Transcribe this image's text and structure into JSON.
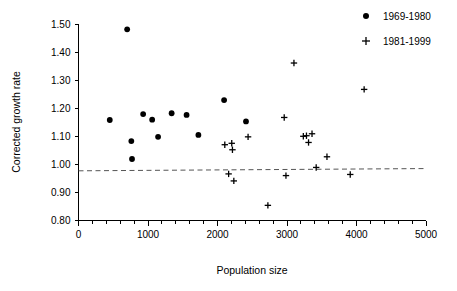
{
  "chart_data": {
    "type": "scatter",
    "title": "",
    "xlabel": "Population size",
    "ylabel": "Corrected growth rate",
    "xlim": [
      0,
      5000
    ],
    "ylim": [
      0.8,
      1.5
    ],
    "xticks": [
      0,
      1000,
      2000,
      3000,
      4000,
      5000
    ],
    "xtick_labels": [
      "0",
      "1000",
      "2000",
      "3000",
      "4000",
      "5000"
    ],
    "xminor_interval": 200,
    "yticks": [
      0.8,
      0.9,
      1.0,
      1.1,
      1.2,
      1.3,
      1.4,
      1.5
    ],
    "ytick_labels": [
      "0.80",
      "0.90",
      "1.00",
      "1.10",
      "1.20",
      "1.30",
      "1.40",
      "1.50"
    ],
    "grid": false,
    "legend_position": "top-right",
    "reference_line": {
      "style": "dashed",
      "label": "",
      "x_start": 0,
      "y_start": 0.977,
      "x_end": 5000,
      "y_end": 0.985,
      "color": "#555555"
    },
    "series": [
      {
        "name": "1969-1980",
        "marker": "filled-circle",
        "color": "#000000",
        "points": [
          {
            "x": 450,
            "y": 1.158
          },
          {
            "x": 700,
            "y": 1.481
          },
          {
            "x": 760,
            "y": 1.083
          },
          {
            "x": 770,
            "y": 1.019
          },
          {
            "x": 930,
            "y": 1.179
          },
          {
            "x": 1060,
            "y": 1.159
          },
          {
            "x": 1145,
            "y": 1.098
          },
          {
            "x": 1340,
            "y": 1.182
          },
          {
            "x": 1555,
            "y": 1.176
          },
          {
            "x": 1725,
            "y": 1.105
          },
          {
            "x": 2095,
            "y": 1.229
          },
          {
            "x": 2410,
            "y": 1.153
          }
        ]
      },
      {
        "name": "1981-1999",
        "marker": "plus",
        "color": "#000000",
        "points": [
          {
            "x": 2105,
            "y": 1.07
          },
          {
            "x": 2160,
            "y": 0.966
          },
          {
            "x": 2205,
            "y": 1.075
          },
          {
            "x": 2215,
            "y": 1.052
          },
          {
            "x": 2235,
            "y": 0.941
          },
          {
            "x": 2440,
            "y": 1.098
          },
          {
            "x": 2725,
            "y": 0.854
          },
          {
            "x": 2960,
            "y": 1.167
          },
          {
            "x": 2985,
            "y": 0.96
          },
          {
            "x": 3100,
            "y": 1.361
          },
          {
            "x": 3235,
            "y": 1.1
          },
          {
            "x": 3280,
            "y": 1.102
          },
          {
            "x": 3310,
            "y": 1.078
          },
          {
            "x": 3360,
            "y": 1.109
          },
          {
            "x": 3420,
            "y": 0.989
          },
          {
            "x": 3575,
            "y": 1.027
          },
          {
            "x": 3910,
            "y": 0.964
          },
          {
            "x": 4110,
            "y": 1.267
          }
        ]
      }
    ]
  },
  "legend": {
    "entries": [
      {
        "label": "1969-1980",
        "marker": "filled-circle"
      },
      {
        "label": "1981-1999",
        "marker": "plus"
      }
    ]
  }
}
